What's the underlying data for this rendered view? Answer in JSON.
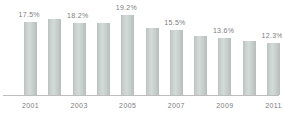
{
  "chart_data": {
    "type": "bar",
    "title": "",
    "subtitle": "",
    "xlabel": "",
    "ylabel": "",
    "grid": false,
    "legend": false,
    "ylim": [
      0,
      21
    ],
    "categories": [
      "2001",
      "2002",
      "2003",
      "2004",
      "2005",
      "2006",
      "2007",
      "2008",
      "2009",
      "2010",
      "2011"
    ],
    "values": [
      17.5,
      18.2,
      17.3,
      17.3,
      19.2,
      15.9,
      15.5,
      14.2,
      13.6,
      12.8,
      12.3
    ],
    "bar_color": "#c6cecb",
    "axis_color": "#bdbdbd",
    "label_color": "#7d7d7d",
    "visible_x_tick_labels": [
      "2001",
      "2003",
      "2005",
      "2007",
      "2009",
      "2011"
    ],
    "data_labels": [
      {
        "category": "2001",
        "text": "17.5%"
      },
      {
        "category": "2003",
        "text": "18.2%"
      },
      {
        "category": "2005",
        "text": "19.2%"
      },
      {
        "category": "2007",
        "text": "15.5%"
      },
      {
        "category": "2009",
        "text": "13.6%"
      },
      {
        "category": "2011",
        "text": "12.3%"
      }
    ]
  }
}
